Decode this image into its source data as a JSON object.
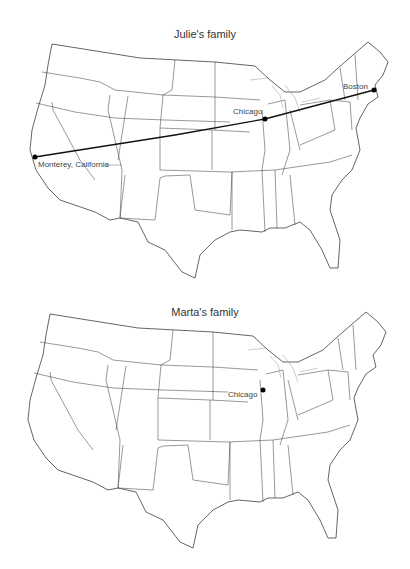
{
  "maps": [
    {
      "title": "Julie's family",
      "cities": [
        {
          "name": "Monterey, California",
          "x": 35,
          "y": 157
        },
        {
          "name": "Chicago",
          "x": 265,
          "y": 119
        },
        {
          "name": "Boston",
          "x": 374,
          "y": 90
        }
      ],
      "route": [
        "Monterey, California",
        "Chicago",
        "Boston"
      ]
    },
    {
      "title": "Marta's family",
      "cities": [
        {
          "name": "Chicago",
          "x": 263,
          "y": 100
        }
      ],
      "route": []
    }
  ]
}
